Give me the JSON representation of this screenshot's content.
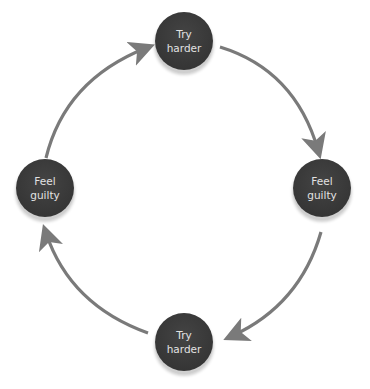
{
  "diagram": {
    "type": "cycle",
    "arrow_color": "#7a7a7a",
    "node_color": "#3a3a3a",
    "nodes": [
      {
        "id": "top",
        "line1": "Try",
        "line2": "harder"
      },
      {
        "id": "right",
        "line1": "Feel",
        "line2": "guilty"
      },
      {
        "id": "bottom",
        "line1": "Try",
        "line2": "harder"
      },
      {
        "id": "left",
        "line1": "Feel",
        "line2": "guilty"
      }
    ],
    "edges": [
      {
        "from": "top",
        "to": "right"
      },
      {
        "from": "right",
        "to": "bottom"
      },
      {
        "from": "bottom",
        "to": "left"
      },
      {
        "from": "left",
        "to": "top"
      }
    ]
  }
}
